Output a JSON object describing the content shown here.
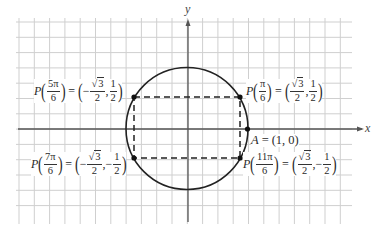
{
  "diagram": {
    "axes": {
      "x_label": "x",
      "y_label": "y"
    },
    "colors": {
      "grid": "#c8c8c8",
      "axis": "#555555",
      "circle": "#222222",
      "dash": "#222222",
      "point": "#111111"
    },
    "points": [
      {
        "id": "p-5pi-6",
        "func": "P",
        "angle_num": "5π",
        "angle_den": "6",
        "x_sign": "−",
        "x_num": "3",
        "x_den": "2",
        "y_sign": "",
        "y_num": "1",
        "y_den": "2"
      },
      {
        "id": "p-pi-6",
        "func": "P",
        "angle_num": "π",
        "angle_den": "6",
        "x_sign": "",
        "x_num": "3",
        "x_den": "2",
        "y_sign": "",
        "y_num": "1",
        "y_den": "2"
      },
      {
        "id": "p-7pi-6",
        "func": "P",
        "angle_num": "7π",
        "angle_den": "6",
        "x_sign": "−",
        "x_num": "3",
        "x_den": "2",
        "y_sign": "−",
        "y_num": "1",
        "y_den": "2"
      },
      {
        "id": "p-11pi-6",
        "func": "P",
        "angle_num": "11π",
        "angle_den": "6",
        "x_sign": "",
        "x_num": "3",
        "x_den": "2",
        "y_sign": "−",
        "y_num": "1",
        "y_den": "2"
      }
    ],
    "point_a": {
      "name": "A",
      "eq": "=",
      "coords": "(1, 0)"
    },
    "symbols": {
      "eq": "=",
      "lparen": "(",
      "rparen": ")",
      "comma": ",",
      "sqrt": "√"
    }
  }
}
